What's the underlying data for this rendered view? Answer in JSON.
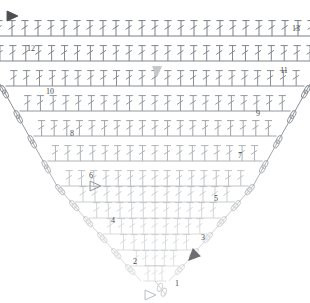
{
  "document": {
    "kind": "crochet-stitch-chart",
    "title": "Triangular Shawl Crochet Chart",
    "background_color": "#ffffff",
    "stroke_color": "#7a7f85",
    "label_color": "#4a4a4a",
    "marker_fill_color": "#6e6e72",
    "marker_outline_color": "#8d9197",
    "width": 310,
    "height": 303
  },
  "chart_data": {
    "type": "diagram",
    "xlabel": "",
    "ylabel": "",
    "grid": false,
    "legend_position": "none",
    "stitch_symbol": "double-crochet",
    "chain_symbol": "chain-oval",
    "row_count": 13,
    "row_numbers_left": [
      12,
      10,
      8,
      6,
      4,
      2
    ],
    "row_numbers_right": [
      13,
      11,
      9,
      7,
      5,
      3,
      1
    ],
    "rows": [
      {
        "number": 1,
        "y": 281,
        "half_width": 14,
        "stitches": 3,
        "opacity": 0.22
      },
      {
        "number": 2,
        "y": 266,
        "half_width": 28,
        "stitches": 5,
        "opacity": 0.24
      },
      {
        "number": 3,
        "y": 250,
        "half_width": 42,
        "stitches": 7,
        "opacity": 0.26
      },
      {
        "number": 4,
        "y": 234,
        "half_width": 56,
        "stitches": 9,
        "opacity": 0.28
      },
      {
        "number": 5,
        "y": 218,
        "half_width": 70,
        "stitches": 11,
        "opacity": 0.32
      },
      {
        "number": 6,
        "y": 202,
        "half_width": 84,
        "stitches": 13,
        "opacity": 0.38
      },
      {
        "number": 7,
        "y": 186,
        "half_width": 98,
        "stitches": 15,
        "opacity": 0.46
      },
      {
        "number": 8,
        "y": 161,
        "half_width": 112,
        "stitches": 17,
        "opacity": 0.58
      },
      {
        "number": 9,
        "y": 136,
        "half_width": 126,
        "stitches": 19,
        "opacity": 0.7
      },
      {
        "number": 10,
        "y": 111,
        "half_width": 140,
        "stitches": 21,
        "opacity": 0.8
      },
      {
        "number": 11,
        "y": 86,
        "half_width": 154,
        "stitches": 23,
        "opacity": 0.88
      },
      {
        "number": 12,
        "y": 61,
        "half_width": 168,
        "stitches": 25,
        "opacity": 0.94
      },
      {
        "number": 13,
        "y": 36,
        "half_width": 182,
        "stitches": 27,
        "opacity": 1.0
      }
    ],
    "row_number_labels": [
      {
        "text": "13",
        "x": 296,
        "y": 29
      },
      {
        "text": "12",
        "x": 31,
        "y": 49
      },
      {
        "text": "11",
        "x": 284,
        "y": 71
      },
      {
        "text": "10",
        "x": 50,
        "y": 92
      },
      {
        "text": "9",
        "x": 258,
        "y": 114
      },
      {
        "text": "8",
        "x": 72,
        "y": 134
      },
      {
        "text": "7",
        "x": 240,
        "y": 156
      },
      {
        "text": "6",
        "x": 91,
        "y": 176
      },
      {
        "text": "5",
        "x": 216,
        "y": 199
      },
      {
        "text": "4",
        "x": 113,
        "y": 221
      },
      {
        "text": "3",
        "x": 203,
        "y": 238
      },
      {
        "text": "2",
        "x": 135,
        "y": 262
      },
      {
        "text": "1",
        "x": 177,
        "y": 284
      }
    ],
    "markers": [
      {
        "name": "start-arrow-top-left",
        "type": "filled-triangle",
        "x": 12,
        "y": 16,
        "rotation": 0,
        "size": 9,
        "color": "#4d4d52"
      },
      {
        "name": "direction-arrow-center",
        "type": "filled-triangle",
        "x": 157,
        "y": 71,
        "rotation": 90,
        "size": 8,
        "color": "#c4c8cd"
      },
      {
        "name": "direction-arrow-row-3",
        "type": "filled-triangle",
        "x": 193,
        "y": 256,
        "rotation": 135,
        "size": 9,
        "color": "#6e6e72"
      },
      {
        "name": "open-arrow-row-6",
        "type": "outline-triangle",
        "x": 95,
        "y": 186,
        "rotation": 0,
        "size": 9,
        "color": "#8d9197"
      },
      {
        "name": "open-arrow-row-1-bottom",
        "type": "outline-triangle",
        "x": 150,
        "y": 295,
        "rotation": 0,
        "size": 9,
        "color": "#b9bdc2"
      }
    ]
  }
}
